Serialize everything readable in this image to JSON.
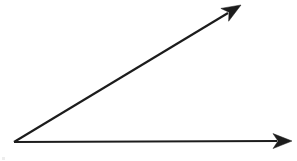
{
  "figure": {
    "kind": "geometry-figure",
    "description": "Acute angle formed by two rays sharing a common vertex",
    "background_color": "#ffffff",
    "ink_color": "#1c1c1c",
    "canvas": {
      "width": 297,
      "height": 161
    },
    "vertex": {
      "name": "angle-vertex",
      "x": 14,
      "y": 142
    },
    "rays": [
      {
        "name": "horizontal-ray",
        "label": "",
        "from": {
          "x": 14,
          "y": 142
        },
        "to": {
          "x": 292,
          "y": 141
        },
        "shaft_end": {
          "x": 277,
          "y": 141
        },
        "arrowhead": "solid-triangle",
        "direction_degrees": 0,
        "stroke_width": 2.1
      },
      {
        "name": "diagonal-ray",
        "label": "",
        "from": {
          "x": 14,
          "y": 142
        },
        "to": {
          "x": 241,
          "y": 5
        },
        "shaft_end": {
          "x": 228,
          "y": 13
        },
        "arrowhead": "solid-triangle",
        "direction_degrees": 31,
        "stroke_width": 2.1
      }
    ],
    "angle": {
      "name": "interior-angle",
      "measure_degrees": 31,
      "type": "acute",
      "arc_shown": false,
      "label_shown": false
    },
    "artifacts": [
      {
        "name": "scan-speck",
        "x": 2,
        "y": 157,
        "width": 3,
        "height": 3
      }
    ]
  }
}
